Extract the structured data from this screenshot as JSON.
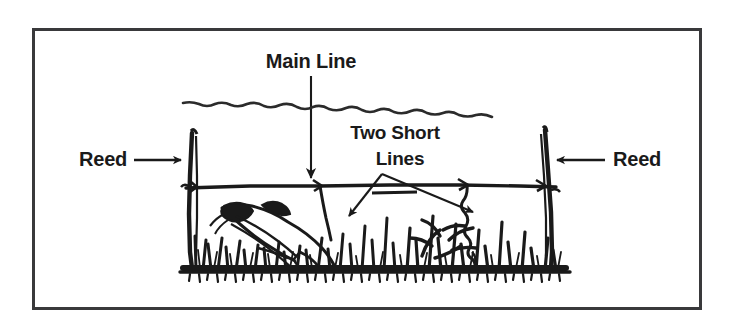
{
  "figure": {
    "kind": "line-drawing-diagram",
    "background_color": "#ffffff",
    "ink_color": "#1a1a1a",
    "border_color": "#39393b",
    "border_width_px": 3
  },
  "labels": {
    "main_line": "Main Line",
    "two_short_lines_line1": "Two Short",
    "two_short_lines_line2": "Lines",
    "reed_left": "Reed",
    "reed_right": "Reed"
  },
  "callouts": [
    {
      "name": "main-line-callout",
      "label": "Main Line",
      "arrow_direction": "down",
      "points_to": "horizontal main line strung between the reeds"
    },
    {
      "name": "two-short-lines-callout",
      "label": "Two Short Lines",
      "arrow_direction": "forked-down-left-and-down-right",
      "points_to": "the two short drop lines hanging from the main line"
    },
    {
      "name": "reed-left-callout",
      "label": "Reed",
      "arrow_direction": "right",
      "points_to": "left reed stalk"
    },
    {
      "name": "reed-right-callout",
      "label": "Reed",
      "arrow_direction": "left",
      "points_to": "right reed stalk"
    }
  ],
  "scene_elements": [
    {
      "name": "water-surface-line",
      "description": "wavy horizontal water surface line"
    },
    {
      "name": "reed-left",
      "description": "vertical reed stalk on the left"
    },
    {
      "name": "reed-right",
      "description": "vertical reed stalk on the right"
    },
    {
      "name": "main-line",
      "description": "horizontal line tied between the two reeds"
    },
    {
      "name": "short-line-left",
      "description": "short drop line on the left with a hooked fish"
    },
    {
      "name": "short-line-right",
      "description": "short drop line on the right"
    },
    {
      "name": "fish",
      "description": "catfish hooked on the left short line"
    },
    {
      "name": "bottom-vegetation",
      "description": "grass and weeds along the lake bottom"
    }
  ]
}
